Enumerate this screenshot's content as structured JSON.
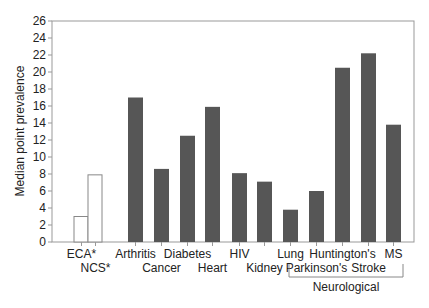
{
  "chart_data": {
    "type": "bar",
    "title": "",
    "xlabel": "",
    "ylabel": "Median point prevalence",
    "ylim": [
      0,
      26
    ],
    "yticks": [
      0,
      2,
      4,
      6,
      8,
      10,
      12,
      14,
      16,
      18,
      20,
      22,
      24,
      26
    ],
    "grid": false,
    "legend": null,
    "categories": [
      "ECA*",
      "NCS*",
      "Arthritis",
      "Cancer",
      "Diabetes",
      "Heart",
      "HIV",
      "Kidney",
      "Lung",
      "Parkinson's",
      "Huntington's",
      "Stroke",
      "MS"
    ],
    "values": [
      3.0,
      7.9,
      17.0,
      8.6,
      12.5,
      15.9,
      8.1,
      7.1,
      3.8,
      6.0,
      20.5,
      22.2,
      13.8
    ],
    "bar_style": [
      "outline",
      "outline",
      "filled",
      "filled",
      "filled",
      "filled",
      "filled",
      "filled",
      "filled",
      "filled",
      "filled",
      "filled",
      "filled"
    ],
    "label_row": [
      0,
      1,
      0,
      1,
      0,
      1,
      0,
      1,
      0,
      1,
      0,
      1,
      0
    ],
    "groups": [
      {
        "label": "Neurological",
        "members": [
          "Lung",
          "Parkinson's",
          "Huntington's",
          "Stroke",
          "MS"
        ]
      }
    ],
    "annotations": [
      "* ECA and NCS shown as unfilled bars"
    ],
    "colors": {
      "filled": "#565656",
      "outline_stroke": "#888888",
      "axis": "#888888",
      "text": "#222222"
    }
  }
}
